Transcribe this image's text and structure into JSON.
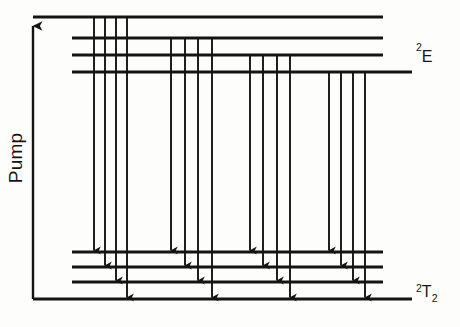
{
  "figure": {
    "title": "",
    "kind": "energy-level-transition-diagram",
    "background_color": "#fdfdfb",
    "ink_color": "#141414"
  },
  "axis": {
    "pump_label": "Pump",
    "pump_label_orientation": "vertical-bottom-to-top",
    "arrow_direction": "up",
    "x": 33,
    "y_top": 17,
    "y_bottom": 299
  },
  "labels": {
    "upper_manifold": {
      "sup": "2",
      "main": "E",
      "sub": "",
      "text": "2E",
      "x": 416,
      "y": 62
    },
    "lower_manifold": {
      "sup": "2",
      "main": "T",
      "sub": "2",
      "text": "2T2",
      "x": 416,
      "y": 297
    }
  },
  "chart_data": {
    "type": "diagram",
    "title": "",
    "xlabel": "",
    "ylabel": "Pump",
    "upper_levels": [
      {
        "id": "E1",
        "y": 17,
        "x_start": 33,
        "x_end": 383
      },
      {
        "id": "E2",
        "y": 38,
        "x_start": 72,
        "x_end": 383
      },
      {
        "id": "E3",
        "y": 55,
        "x_start": 72,
        "x_end": 383
      },
      {
        "id": "E4",
        "y": 72,
        "x_start": 72,
        "x_end": 412
      }
    ],
    "lower_levels": [
      {
        "id": "T1",
        "y": 252,
        "x_start": 72,
        "x_end": 383
      },
      {
        "id": "T2",
        "y": 267,
        "x_start": 72,
        "x_end": 383
      },
      {
        "id": "T3",
        "y": 282,
        "x_start": 72,
        "x_end": 383
      },
      {
        "id": "T4",
        "y": 299,
        "x_start": 33,
        "x_end": 412
      }
    ],
    "transition_groups": [
      {
        "id": "group-1",
        "from_level": "E1",
        "y_start": 17,
        "arrows": [
          {
            "x": 94,
            "y_end": 252,
            "to_level": "T1"
          },
          {
            "x": 105,
            "y_end": 267,
            "to_level": "T2"
          },
          {
            "x": 116,
            "y_end": 282,
            "to_level": "T3"
          },
          {
            "x": 127,
            "y_end": 299,
            "to_level": "T4"
          }
        ]
      },
      {
        "id": "group-2",
        "from_level": "E2",
        "y_start": 38,
        "arrows": [
          {
            "x": 171,
            "y_end": 252,
            "to_level": "T1"
          },
          {
            "x": 185,
            "y_end": 267,
            "to_level": "T2"
          },
          {
            "x": 198,
            "y_end": 282,
            "to_level": "T3"
          },
          {
            "x": 212,
            "y_end": 299,
            "to_level": "T4"
          }
        ]
      },
      {
        "id": "group-3",
        "from_level": "E3",
        "y_start": 55,
        "arrows": [
          {
            "x": 250,
            "y_end": 252,
            "to_level": "T1"
          },
          {
            "x": 263,
            "y_end": 267,
            "to_level": "T2"
          },
          {
            "x": 277,
            "y_end": 282,
            "to_level": "T3"
          },
          {
            "x": 290,
            "y_end": 299,
            "to_level": "T4"
          }
        ]
      },
      {
        "id": "group-4",
        "from_level": "E4",
        "y_start": 72,
        "arrows": [
          {
            "x": 329,
            "y_end": 252,
            "to_level": "T1"
          },
          {
            "x": 341,
            "y_end": 267,
            "to_level": "T2"
          },
          {
            "x": 353,
            "y_end": 282,
            "to_level": "T3"
          },
          {
            "x": 365,
            "y_end": 299,
            "to_level": "T4"
          }
        ]
      }
    ]
  }
}
